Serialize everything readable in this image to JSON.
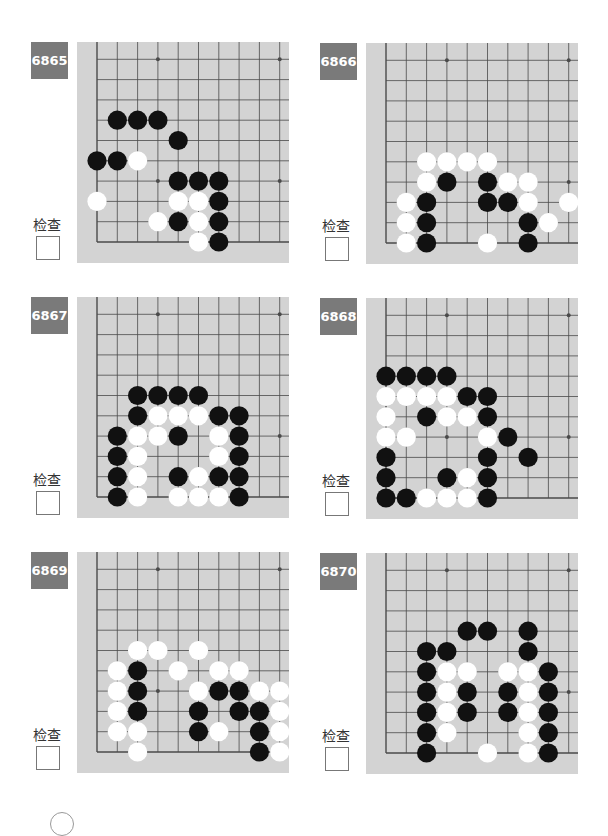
{
  "check_label": "检查",
  "colors": {
    "board": "#d3d3d3",
    "badge": "#7a7a7a",
    "line": "#4a4a4a",
    "black": "#111111",
    "white": "#ffffff"
  },
  "problems": [
    {
      "number": "6865",
      "black": [
        [
          1,
          6
        ],
        [
          2,
          6
        ],
        [
          3,
          6
        ],
        [
          4,
          5
        ],
        [
          0,
          4
        ],
        [
          1,
          4
        ],
        [
          4,
          3
        ],
        [
          5,
          3
        ],
        [
          6,
          3
        ],
        [
          6,
          2
        ],
        [
          4,
          1
        ],
        [
          6,
          1
        ],
        [
          6,
          0
        ]
      ],
      "white": [
        [
          2,
          4
        ],
        [
          0,
          2
        ],
        [
          4,
          2
        ],
        [
          5,
          2
        ],
        [
          3,
          1
        ],
        [
          5,
          1
        ],
        [
          5,
          0
        ]
      ]
    },
    {
      "number": "6866",
      "black": [
        [
          3,
          3
        ],
        [
          5,
          3
        ],
        [
          2,
          2
        ],
        [
          5,
          2
        ],
        [
          6,
          2
        ],
        [
          2,
          1
        ],
        [
          7,
          1
        ],
        [
          2,
          0
        ],
        [
          7,
          0
        ]
      ],
      "white": [
        [
          2,
          4
        ],
        [
          3,
          4
        ],
        [
          4,
          4
        ],
        [
          5,
          4
        ],
        [
          2,
          3
        ],
        [
          6,
          3
        ],
        [
          7,
          3
        ],
        [
          1,
          2
        ],
        [
          7,
          2
        ],
        [
          9,
          2
        ],
        [
          1,
          1
        ],
        [
          8,
          1
        ],
        [
          1,
          0
        ],
        [
          5,
          0
        ]
      ]
    },
    {
      "number": "6867",
      "black": [
        [
          2,
          5
        ],
        [
          3,
          5
        ],
        [
          4,
          5
        ],
        [
          5,
          5
        ],
        [
          2,
          4
        ],
        [
          6,
          4
        ],
        [
          7,
          4
        ],
        [
          1,
          3
        ],
        [
          4,
          3
        ],
        [
          7,
          3
        ],
        [
          1,
          2
        ],
        [
          7,
          2
        ],
        [
          1,
          1
        ],
        [
          4,
          1
        ],
        [
          6,
          1
        ],
        [
          7,
          1
        ],
        [
          1,
          0
        ],
        [
          7,
          0
        ]
      ],
      "white": [
        [
          3,
          4
        ],
        [
          4,
          4
        ],
        [
          5,
          4
        ],
        [
          2,
          3
        ],
        [
          3,
          3
        ],
        [
          6,
          3
        ],
        [
          2,
          2
        ],
        [
          6,
          2
        ],
        [
          2,
          1
        ],
        [
          5,
          1
        ],
        [
          2,
          0
        ],
        [
          4,
          0
        ],
        [
          5,
          0
        ],
        [
          6,
          0
        ]
      ]
    },
    {
      "number": "6868",
      "black": [
        [
          0,
          6
        ],
        [
          1,
          6
        ],
        [
          2,
          6
        ],
        [
          3,
          6
        ],
        [
          4,
          5
        ],
        [
          5,
          5
        ],
        [
          2,
          4
        ],
        [
          5,
          4
        ],
        [
          6,
          3
        ],
        [
          0,
          2
        ],
        [
          5,
          2
        ],
        [
          7,
          2
        ],
        [
          0,
          1
        ],
        [
          3,
          1
        ],
        [
          5,
          1
        ],
        [
          0,
          0
        ],
        [
          1,
          0
        ],
        [
          5,
          0
        ]
      ],
      "white": [
        [
          0,
          5
        ],
        [
          1,
          5
        ],
        [
          2,
          5
        ],
        [
          3,
          5
        ],
        [
          0,
          4
        ],
        [
          3,
          4
        ],
        [
          4,
          4
        ],
        [
          0,
          3
        ],
        [
          1,
          3
        ],
        [
          5,
          3
        ],
        [
          4,
          1
        ],
        [
          2,
          0
        ],
        [
          3,
          0
        ],
        [
          4,
          0
        ]
      ]
    },
    {
      "number": "6869",
      "black": [
        [
          2,
          4
        ],
        [
          2,
          3
        ],
        [
          6,
          3
        ],
        [
          7,
          3
        ],
        [
          2,
          2
        ],
        [
          5,
          2
        ],
        [
          7,
          2
        ],
        [
          8,
          2
        ],
        [
          5,
          1
        ],
        [
          8,
          1
        ],
        [
          8,
          0
        ]
      ],
      "white": [
        [
          2,
          5
        ],
        [
          3,
          5
        ],
        [
          5,
          5
        ],
        [
          1,
          4
        ],
        [
          4,
          4
        ],
        [
          6,
          4
        ],
        [
          7,
          4
        ],
        [
          1,
          3
        ],
        [
          5,
          3
        ],
        [
          8,
          3
        ],
        [
          9,
          3
        ],
        [
          1,
          2
        ],
        [
          9,
          2
        ],
        [
          1,
          1
        ],
        [
          2,
          1
        ],
        [
          6,
          1
        ],
        [
          9,
          1
        ],
        [
          2,
          0
        ],
        [
          9,
          0
        ]
      ]
    },
    {
      "number": "6870",
      "black": [
        [
          4,
          6
        ],
        [
          5,
          6
        ],
        [
          7,
          6
        ],
        [
          2,
          5
        ],
        [
          3,
          5
        ],
        [
          7,
          5
        ],
        [
          2,
          4
        ],
        [
          8,
          4
        ],
        [
          2,
          3
        ],
        [
          4,
          3
        ],
        [
          6,
          3
        ],
        [
          8,
          3
        ],
        [
          2,
          2
        ],
        [
          4,
          2
        ],
        [
          6,
          2
        ],
        [
          8,
          2
        ],
        [
          2,
          1
        ],
        [
          8,
          1
        ],
        [
          2,
          0
        ],
        [
          8,
          0
        ]
      ],
      "white": [
        [
          3,
          4
        ],
        [
          4,
          4
        ],
        [
          6,
          4
        ],
        [
          7,
          4
        ],
        [
          3,
          3
        ],
        [
          7,
          3
        ],
        [
          3,
          2
        ],
        [
          7,
          2
        ],
        [
          3,
          1
        ],
        [
          7,
          1
        ],
        [
          5,
          0
        ],
        [
          7,
          0
        ]
      ]
    }
  ]
}
